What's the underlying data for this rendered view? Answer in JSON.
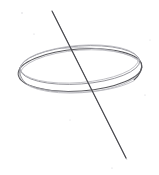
{
  "figure": {
    "medium": "pencil sketch on white paper",
    "background_color": "#ffffff",
    "canvas": {
      "width": 159,
      "height": 175
    },
    "ink_colors": {
      "ring_primary": "#5a5a5e",
      "ring_secondary": "#8d8d93",
      "ring_faint": "#b4b4ba",
      "line_primary": "#46464b",
      "line_ghost": "#9a9aa0",
      "paper_speck": "#cfcfd4"
    },
    "elements": [
      {
        "name": "ring-outer-ellipse",
        "kind": "ellipse",
        "role": "outer rim of ring seen in perspective",
        "center": {
          "x": 80,
          "y": 70
        },
        "radius": {
          "x": 62,
          "y": 21
        },
        "rotation_deg": -4,
        "stroke": "#5a5a5e"
      },
      {
        "name": "ring-inner-ellipse",
        "kind": "ellipse",
        "role": "inner rim of ring, offset upward to suggest band thickness",
        "center": {
          "x": 80,
          "y": 65
        },
        "radius": {
          "x": 60,
          "y": 19
        },
        "rotation_deg": -4,
        "stroke": "#8d8d93"
      },
      {
        "name": "diagonal-line",
        "kind": "line",
        "role": "straight line piercing the ring from upper-left to lower-right",
        "start": {
          "x": 52,
          "y": 11
        },
        "end": {
          "x": 126,
          "y": 158
        },
        "stroke": "#46464b",
        "slope_description": "steep, descending left to right"
      }
    ],
    "intersections": [
      {
        "name": "upper-crossing",
        "x": 76,
        "y": 55,
        "description": "line crosses the back/top rim of the ring"
      },
      {
        "name": "lower-crossing",
        "x": 94,
        "y": 92,
        "description": "line crosses the front/bottom rim of the ring"
      }
    ],
    "bounds": {
      "ring_left_x": 19,
      "ring_right_x": 142,
      "ring_top_y": 46,
      "ring_bottom_y": 95
    }
  }
}
